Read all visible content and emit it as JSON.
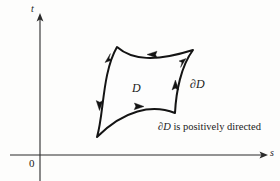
{
  "figure": {
    "axes": {
      "y_label": "t",
      "x_label": "s",
      "origin_label": "0",
      "y_axis_x": 40,
      "x_axis_y": 155
    },
    "region_label": "D",
    "boundary_label": "∂D",
    "caption": {
      "symbol": "∂D",
      "text": " is positively directed",
      "full": "∂D is positively directed"
    },
    "orientation": "counterclockwise",
    "colors": {
      "ink": "#141414",
      "axis": "#2b2b2b",
      "background": "#fdfdfc"
    },
    "curve": {
      "corners": [
        {
          "name": "top-left",
          "x": 117,
          "y": 47
        },
        {
          "name": "top-right",
          "x": 193,
          "y": 50
        },
        {
          "name": "bottom-right",
          "x": 175,
          "y": 113
        },
        {
          "name": "bottom-left",
          "x": 97,
          "y": 137
        }
      ],
      "path": "M 117 47 C 132 60, 155 62, 193 50 C 181 66, 176 92, 175 113 C 152 104, 124 110, 97 137 C 104 114, 102 73, 117 47 Z",
      "arrow_count": 6
    }
  }
}
